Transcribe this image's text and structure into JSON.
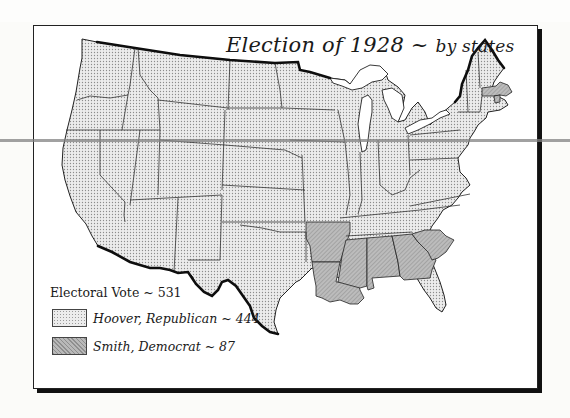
{
  "map": {
    "title": "Election of 1928",
    "title_separator": "~",
    "subtitle": "by states",
    "legend": {
      "heading": "Electoral Vote ~ 531",
      "entries": [
        {
          "label": "Hoover, Republican ~ 444",
          "candidate": "Hoover",
          "party": "Republican",
          "electoral_votes": 444,
          "pattern": "dotted-light",
          "color": "#e6e6e6"
        },
        {
          "label": "Smith, Democrat ~  87",
          "candidate": "Smith",
          "party": "Democrat",
          "electoral_votes": 87,
          "pattern": "hatched-dark",
          "color": "#b3b3b3"
        }
      ]
    },
    "smith_states": [
      "Massachusetts",
      "Rhode Island",
      "Arkansas",
      "Louisiana",
      "Mississippi",
      "Alabama",
      "Georgia",
      "South Carolina"
    ],
    "colors": {
      "hoover_fill": "#e6e6e6",
      "smith_fill": "#b3b3b3",
      "border": "#222222",
      "coast": "#111111"
    }
  }
}
